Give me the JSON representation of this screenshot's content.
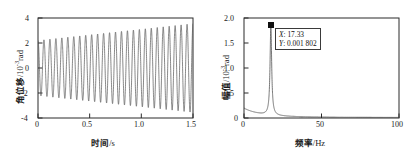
{
  "figure": {
    "background": "#ffffff",
    "line_color": "#555555",
    "axis_color": "#2b2b2b"
  },
  "chart_data": [
    {
      "id": "left",
      "type": "line",
      "title": "",
      "xlabel_cjk": "时间",
      "xlabel_unit": "/s",
      "ylabel_cjk": "角位移",
      "ylabel_unit_pre": "/10",
      "ylabel_unit_sup": "-3",
      "ylabel_unit_post": "rad",
      "xlim": [
        0,
        1.5
      ],
      "ylim": [
        -4,
        4
      ],
      "xticks": [
        0,
        0.5,
        1.0,
        1.5
      ],
      "xtick_labels": [
        "0",
        "0.5",
        "1.0",
        "1.5"
      ],
      "yticks": [
        -4,
        -2,
        0,
        2,
        4
      ],
      "ytick_labels": [
        "-4",
        "-2",
        "0",
        "2",
        "4"
      ],
      "grid": false,
      "legend": "none",
      "series": [
        {
          "name": "angular-displacement",
          "description": "growing-amplitude sinusoid, frequency 17.33 Hz, amplitude rises from 2.2 to 3.5",
          "frequency_hz": 17.33,
          "amplitude_start": 2.2,
          "amplitude_end": 3.55,
          "n_samples": 3000
        }
      ]
    },
    {
      "id": "right",
      "type": "line",
      "title": "",
      "xlabel_cjk": "频率",
      "xlabel_unit": "/Hz",
      "ylabel_cjk": "幅值",
      "ylabel_unit_pre": "/10",
      "ylabel_unit_sup": "-3",
      "ylabel_unit_post": "rad",
      "xlim": [
        0,
        100
      ],
      "ylim": [
        0,
        2.0
      ],
      "xticks": [
        0,
        50,
        100
      ],
      "xtick_labels": [
        "0",
        "50",
        "100"
      ],
      "yticks": [
        0,
        0.5,
        1.0,
        1.5,
        2.0
      ],
      "ytick_labels": [
        "0",
        "0.5",
        "1.0",
        "1.5",
        "2.0"
      ],
      "grid": false,
      "legend": "none",
      "series": [
        {
          "name": "amplitude-spectrum",
          "description": "sharp resonance peak at 17.33 Hz with height 1.802, small low-frequency shoulder and near-zero tail",
          "peak_x": 17.33,
          "peak_y": 1.802,
          "baseline_low": 0.13,
          "baseline_tail": 0.01
        }
      ],
      "annotation": {
        "marker": "filled-square",
        "marker_x": 17.33,
        "marker_y": 1.802,
        "x_label": "X",
        "x_value": "17.33",
        "y_label": "Y",
        "y_value": "0.001 802"
      }
    }
  ]
}
